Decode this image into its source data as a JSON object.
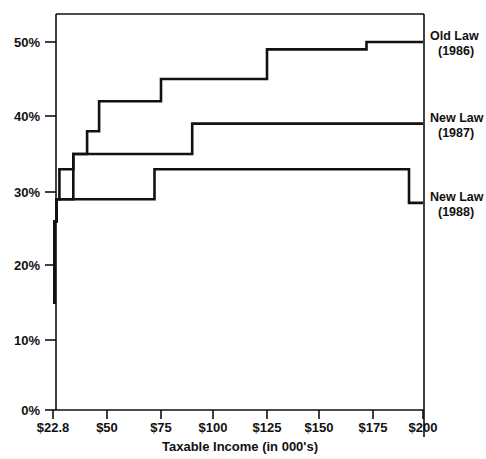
{
  "chart_data": {
    "type": "line",
    "title": "",
    "subtitle": "",
    "xlabel": "Taxable Income (in 000's)",
    "ylabel": "",
    "xlim": [
      22.8,
      200
    ],
    "ylim": [
      0,
      54
    ],
    "grid": false,
    "legend_position": "right-inline",
    "x_ticks": [
      {
        "value": 22.8,
        "label": "$22.8"
      },
      {
        "value": 50,
        "label": "$50"
      },
      {
        "value": 75,
        "label": "$75"
      },
      {
        "value": 100,
        "label": "$100"
      },
      {
        "value": 125,
        "label": "$125"
      },
      {
        "value": 150,
        "label": "$150"
      },
      {
        "value": 175,
        "label": "$175"
      },
      {
        "value": 200,
        "label": "$200"
      }
    ],
    "y_ticks": [
      {
        "value": 0,
        "label": "0%"
      },
      {
        "value": 10,
        "label": "10%"
      },
      {
        "value": 20,
        "label": "20%"
      },
      {
        "value": 30,
        "label": "30%"
      },
      {
        "value": 40,
        "label": "40%"
      },
      {
        "value": 50,
        "label": "50%"
      }
    ],
    "series": [
      {
        "name": "Old Law (1986)",
        "label_line1": "Old Law",
        "label_line2": "(1986)",
        "color": "#111111",
        "steps": [
          {
            "x": 22.8,
            "y": 15
          },
          {
            "x": 23.6,
            "y": 26
          },
          {
            "x": 24.6,
            "y": 29
          },
          {
            "x": 26.0,
            "y": 33
          },
          {
            "x": 33.0,
            "y": 35
          },
          {
            "x": 40.0,
            "y": 38
          },
          {
            "x": 46.0,
            "y": 42
          },
          {
            "x": 75.0,
            "y": 45
          },
          {
            "x": 125.0,
            "y": 49
          },
          {
            "x": 172.0,
            "y": 50
          },
          {
            "x": 200.0,
            "y": 50
          }
        ]
      },
      {
        "name": "New Law (1987)",
        "label_line1": "New Law",
        "label_line2": "(1987)",
        "color": "#111111",
        "steps": [
          {
            "x": 22.8,
            "y": 15
          },
          {
            "x": 23.6,
            "y": 26
          },
          {
            "x": 24.6,
            "y": 29
          },
          {
            "x": 33.0,
            "y": 35
          },
          {
            "x": 90.0,
            "y": 39
          },
          {
            "x": 200.0,
            "y": 39
          }
        ]
      },
      {
        "name": "New Law (1988)",
        "label_line1": "New Law",
        "label_line2": "(1988)",
        "color": "#111111",
        "steps": [
          {
            "x": 22.8,
            "y": 15
          },
          {
            "x": 23.6,
            "y": 26
          },
          {
            "x": 24.6,
            "y": 29
          },
          {
            "x": 72.0,
            "y": 33
          },
          {
            "x": 193.0,
            "y": 28.5
          },
          {
            "x": 200.0,
            "y": 28.5
          }
        ]
      }
    ],
    "annotations": [
      {
        "text": "Old Law",
        "sub": "(1986)",
        "at_x": 200,
        "at_y": 50
      },
      {
        "text": "New Law",
        "sub": "(1987)",
        "at_x": 200,
        "at_y": 39
      },
      {
        "text": "New Law",
        "sub": "(1988)",
        "at_x": 200,
        "at_y": 28.5
      }
    ]
  }
}
